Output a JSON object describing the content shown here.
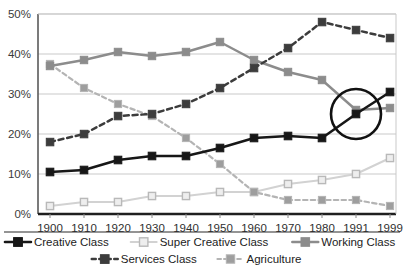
{
  "chart_data": {
    "type": "line",
    "title": "",
    "subtitle": "",
    "xlabel": "",
    "ylabel": "",
    "categories": [
      "1900",
      "1910",
      "1920",
      "1930",
      "1940",
      "1950",
      "1960",
      "1970",
      "1980",
      "1991",
      "1999"
    ],
    "ylim": [
      0,
      50
    ],
    "yticks": [
      0,
      10,
      20,
      30,
      40,
      50
    ],
    "ytick_labels": [
      "0%",
      "10%",
      "20%",
      "30%",
      "40%",
      "50%"
    ],
    "grid": true,
    "grid_axis": "y",
    "legend_position": "bottom",
    "value_suffix": "%",
    "series": [
      {
        "name": "Creative Class",
        "values": [
          10.5,
          11.0,
          13.5,
          14.5,
          14.5,
          16.5,
          19.0,
          19.5,
          19.0,
          25.0,
          30.5
        ],
        "color": "#171717",
        "marker": "filled-square",
        "marker_fill": "#171717",
        "line_style": "solid",
        "line_width": 2.6,
        "marker_size": 7.6
      },
      {
        "name": "Super Creative Class",
        "values": [
          2.0,
          3.0,
          3.0,
          4.5,
          4.5,
          5.5,
          5.5,
          7.5,
          8.5,
          10.0,
          14.0
        ],
        "color": "#d2d2d2",
        "marker": "open-square",
        "marker_fill": "#eeeeee",
        "line_style": "solid",
        "line_width": 2.0,
        "marker_size": 7.2
      },
      {
        "name": "Working Class",
        "values": [
          37.0,
          38.5,
          40.5,
          39.5,
          40.5,
          43.0,
          38.5,
          35.5,
          33.5,
          26.0,
          26.5
        ],
        "color": "#8c8c8c",
        "marker": "filled-square",
        "marker_fill": "#8c8c8c",
        "line_style": "solid",
        "line_width": 2.4,
        "marker_size": 7.4
      },
      {
        "name": "Services Class",
        "values": [
          18.0,
          20.0,
          24.5,
          25.0,
          27.5,
          31.5,
          36.5,
          41.5,
          48.0,
          46.0,
          44.0
        ],
        "color": "#3c3c3c",
        "marker": "filled-square",
        "marker_fill": "#3c3c3c",
        "line_style": "dashed",
        "line_width": 2.5,
        "marker_size": 7.5
      },
      {
        "name": "Agriculture",
        "values": [
          37.5,
          31.5,
          27.5,
          24.5,
          19.0,
          12.5,
          5.5,
          3.5,
          3.5,
          3.5,
          2.0
        ],
        "color": "#b4b4b4",
        "marker": "filled-square",
        "marker_fill": "#9e9e9e",
        "line_style": "dashed",
        "line_width": 2.2,
        "marker_size": 7.2
      }
    ],
    "annotations": [
      {
        "type": "circle",
        "label": "crossover-highlight",
        "at_category": "1991",
        "at_value": 25.0,
        "radius_px": 25
      }
    ]
  },
  "legend": {
    "rows": [
      [
        {
          "label": "Creative Class",
          "series_index": 0
        },
        {
          "label": "Super Creative Class",
          "series_index": 1
        },
        {
          "label": "Working Class",
          "series_index": 2
        }
      ],
      [
        {
          "label": "Services Class",
          "series_index": 3
        },
        {
          "label": "Agriculture",
          "series_index": 4
        }
      ]
    ]
  },
  "style": {
    "background": "#ffffff",
    "plot_background": "#ffffff",
    "grid_color": "#c9c9c9",
    "axis_color": "#5a5a5a",
    "legend_divider_color": "#2b2b2b",
    "tick_color": "#8a8a8a"
  }
}
